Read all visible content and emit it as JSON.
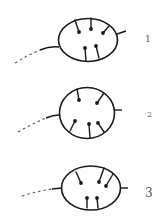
{
  "figure": {
    "type": "line-drawing diagram",
    "stroke_color": "#1a1a1a",
    "labels": [
      "1",
      "2",
      "3"
    ]
  },
  "panels": [
    {
      "label": "1",
      "cell_shape": "ellipse",
      "stalk_count": 5
    },
    {
      "label": "2",
      "cell_shape": "circle",
      "stalk_count": 5
    },
    {
      "label": "3",
      "cell_shape": "ellipse",
      "stalk_count": 5
    }
  ]
}
